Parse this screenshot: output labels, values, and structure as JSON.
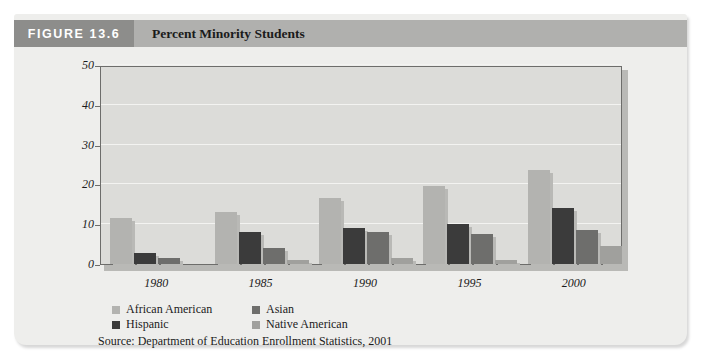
{
  "figure": {
    "number_label": "FIGURE 13.6",
    "caption": "Percent Minority Students",
    "source": "Source: Department of Education Enrollment Statistics, 2001"
  },
  "colors": {
    "header_number_bg": "#8d8d8b",
    "header_caption_bg": "#b0b0ae",
    "panel_bg": "#eeeeec",
    "plot_bg": "#dcdcd9",
    "plot_border": "#6d6d6b",
    "gridline": "#f3f3f1",
    "african_american": "#b3b3b0",
    "asian": "#6e6e6c",
    "hispanic": "#3b3b3b",
    "native_american": "#a0a09d",
    "bar_shadow": "#b9b9b6"
  },
  "chart_data": {
    "type": "bar",
    "title": "Percent Minority Students",
    "xlabel": "",
    "ylabel": "",
    "categories": [
      "1980",
      "1985",
      "1990",
      "1995",
      "2000"
    ],
    "ylim": [
      0,
      50
    ],
    "yticks": [
      0,
      10,
      20,
      30,
      40,
      50
    ],
    "grid": true,
    "legend_position": "bottom-left",
    "series": [
      {
        "name": "African American",
        "color": "#b3b3b0",
        "values": [
          11.5,
          13.0,
          16.5,
          19.5,
          23.5
        ]
      },
      {
        "name": "Hispanic",
        "color": "#3b3b3b",
        "values": [
          2.8,
          8.0,
          9.0,
          10.0,
          14.0
        ]
      },
      {
        "name": "Asian",
        "color": "#6e6e6c",
        "values": [
          1.5,
          4.0,
          8.0,
          7.5,
          8.5
        ]
      },
      {
        "name": "Native American",
        "color": "#a0a09d",
        "values": [
          0.0,
          1.0,
          1.5,
          1.0,
          4.5
        ]
      }
    ]
  }
}
